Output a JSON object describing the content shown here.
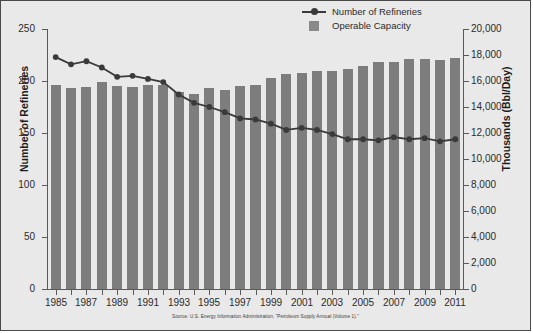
{
  "legend": {
    "items": [
      {
        "label": "Number of Refineries",
        "type": "line-marker",
        "color": "#3a3a3a",
        "key_name": "line-marker-key"
      },
      {
        "label": "Operable Capacity",
        "type": "swatch",
        "color": "#8a8a8a",
        "key_name": "swatch-key"
      }
    ]
  },
  "axes": {
    "left_title": "Number of Refineries",
    "right_title": "Thousands (Bbl/Day)",
    "left_ticks": [
      "0",
      "50",
      "100",
      "150",
      "200",
      "250"
    ],
    "right_ticks": [
      "0",
      "2,000",
      "4,000",
      "6,000",
      "8,000",
      "10,000",
      "12,000",
      "14,000",
      "16,000",
      "18,000",
      "20,000"
    ],
    "x_labels": [
      "1985",
      "1987",
      "1989",
      "1991",
      "1993",
      "1995",
      "1997",
      "1999",
      "2001",
      "2003",
      "2005",
      "2007",
      "2009",
      "2011"
    ]
  },
  "source": "Source: U.S. Energy Information Administration, \"Petroleum Supply Annual (Volume 1).\"",
  "chart_data": {
    "type": "bar",
    "title": "",
    "xlabel": "",
    "ylabel": "Number of Refineries",
    "y2label": "Thousands (Bbl/Day)",
    "ylim": [
      0,
      250
    ],
    "y2lim": [
      0,
      20000
    ],
    "grid": false,
    "legend_position": "top-right",
    "categories": [
      "1985",
      "1986",
      "1987",
      "1988",
      "1989",
      "1990",
      "1991",
      "1992",
      "1993",
      "1994",
      "1995",
      "1996",
      "1997",
      "1998",
      "1999",
      "2000",
      "2001",
      "2002",
      "2003",
      "2004",
      "2005",
      "2006",
      "2007",
      "2008",
      "2009",
      "2010",
      "2011"
    ],
    "series": [
      {
        "name": "Operable Capacity",
        "type": "bar",
        "axis": "right",
        "unit": "Thousands (Bbl/Day)",
        "color": "#7d7d7d",
        "values": [
          15659,
          15459,
          15566,
          15915,
          15655,
          15572,
          15676,
          15696,
          15121,
          15034,
          15434,
          15333,
          15594,
          15711,
          16261,
          16512,
          16595,
          16757,
          16757,
          16894,
          17125,
          17443,
          17443,
          17672,
          17672,
          17585,
          17736
        ]
      },
      {
        "name": "Number of Refineries",
        "type": "line",
        "axis": "left",
        "unit": "count",
        "color": "#3a3a3a",
        "values": [
          223,
          216,
          219,
          213,
          204,
          205,
          202,
          199,
          187,
          179,
          175,
          170,
          164,
          163,
          159,
          153,
          155,
          153,
          149,
          144,
          144,
          143,
          146,
          144,
          145,
          142,
          144
        ]
      }
    ]
  }
}
